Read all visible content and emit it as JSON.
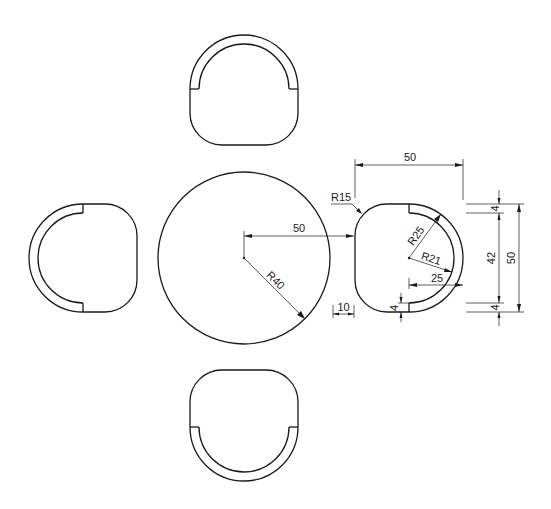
{
  "drawing": {
    "title": "Table and four chairs plan",
    "line_color": "#1a1a1a",
    "background": "#ffffff"
  },
  "table": {
    "radius_label": "R40",
    "center_offset_label": "50"
  },
  "chair": {
    "width_label": "50",
    "corner_radius_label": "R15",
    "outer_back_radius_label": "R25",
    "inner_back_radius_label": "R21",
    "arc_center_offset_label": "25",
    "back_thickness_top_label": "4",
    "back_opening_label": "42",
    "back_thickness_bottom_label": "4",
    "overall_height_label": "50",
    "back_end_thickness_label": "4",
    "gap_label": "10"
  }
}
